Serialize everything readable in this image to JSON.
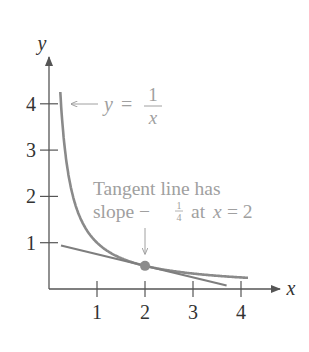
{
  "chart_data": {
    "type": "line",
    "title": "",
    "xlabel": "x",
    "ylabel": "y",
    "xlim": [
      0,
      4.5
    ],
    "ylim": [
      0,
      4.7
    ],
    "grid": false,
    "x_ticks": [
      "1",
      "2",
      "3",
      "4"
    ],
    "y_ticks": [
      "1",
      "2",
      "3",
      "4"
    ],
    "series": [
      {
        "name": "y = 1/x",
        "function": "1/x",
        "x": [
          0.24,
          0.3,
          0.4,
          0.5,
          0.75,
          1.0,
          1.5,
          2.0,
          2.5,
          3.0,
          3.5,
          4.1
        ],
        "y": [
          4.17,
          3.33,
          2.5,
          2.0,
          1.33,
          1.0,
          0.67,
          0.5,
          0.4,
          0.33,
          0.29,
          0.24
        ]
      },
      {
        "name": "Tangent line at x = 2",
        "function": "-x/4 + 1",
        "x": [
          0.25,
          3.7
        ],
        "y": [
          0.94,
          0.075
        ]
      }
    ],
    "points": [
      {
        "x": 2,
        "y": 0.5,
        "label": "point of tangency"
      }
    ],
    "annotations": [
      {
        "text_parts": [
          "y =",
          "1",
          "x"
        ],
        "meaning": "y = 1/x",
        "arrow_to": "curve"
      },
      {
        "line1": "Tangent line has",
        "line2_prefix": "slope −",
        "line2_frac_num": "1",
        "line2_frac_den": "4",
        "line2_mid": "at",
        "line2_var": "x",
        "line2_suffix": "= 2",
        "arrow_to": "point (2, 0.5)"
      }
    ]
  },
  "colors": {
    "axis": "#555555",
    "curve": "#8a8a8a",
    "tangent": "#7e7e7e",
    "point": "#8c8c8c",
    "annotation_text": "#a0a0a0",
    "tick_label": "#333333"
  }
}
